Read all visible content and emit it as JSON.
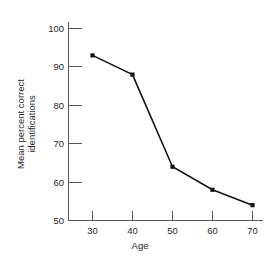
{
  "chart_data": {
    "type": "line",
    "title": "",
    "subtitle": "",
    "xlabel": "Age",
    "ylabel": "Mean percent correct identifications",
    "ylabel_lines": [
      "Mean percent correct",
      "identifications"
    ],
    "x": [
      30,
      40,
      50,
      60,
      70
    ],
    "values": [
      93,
      88,
      64,
      58,
      54
    ],
    "series": [
      {
        "name": "Mean percent correct identifications",
        "values": [
          93,
          88,
          64,
          58,
          54
        ]
      }
    ],
    "xlim": [
      25,
      75
    ],
    "ylim": [
      50,
      100
    ],
    "xticks": [
      30,
      40,
      50,
      60,
      70
    ],
    "yticks": [
      50,
      60,
      70,
      80,
      90,
      100
    ],
    "xtick_labels": [
      "30",
      "40",
      "50",
      "60",
      "70"
    ],
    "ytick_labels": [
      "50",
      "60",
      "70",
      "80",
      "90",
      "100"
    ],
    "grid": false,
    "legend": false,
    "legend_position": "none",
    "marker": "square",
    "line_color": "#141414",
    "marker_color": "#141414",
    "axis_color": "#5a5a5a",
    "background_color": "#ffffff",
    "tick_direction": "in"
  }
}
